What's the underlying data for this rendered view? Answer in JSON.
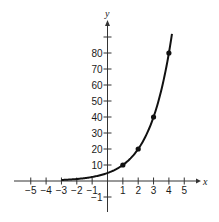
{
  "chart_data": {
    "type": "line",
    "title": "",
    "function": "y = 5 · 2^x",
    "xlabel": "x",
    "ylabel": "y",
    "xlim": [
      -5.5,
      5.8
    ],
    "ylim": [
      -5,
      100
    ],
    "x_ticks": [
      -5,
      -4,
      -3,
      -2,
      -1,
      1,
      2,
      3,
      4,
      5
    ],
    "x_tick_labels": [
      "−5",
      "−4",
      "−3",
      "−2",
      "−1",
      "1",
      "2",
      "3",
      "4",
      "5"
    ],
    "y_ticks": [
      -1,
      10,
      20,
      30,
      40,
      50,
      60,
      70,
      80,
      90
    ],
    "y_tick_labels": [
      "−1",
      "10",
      "20",
      "30",
      "40",
      "50",
      "60",
      "70",
      "80",
      ""
    ],
    "grid": false,
    "legend": null,
    "curve_domain": [
      -3,
      4.2
    ],
    "series": [
      {
        "name": "y = 5·2^x",
        "points": [
          {
            "x": 1,
            "y": 10
          },
          {
            "x": 2,
            "y": 20
          },
          {
            "x": 3,
            "y": 40
          },
          {
            "x": 4,
            "y": 80
          }
        ]
      }
    ],
    "line_color": "#111111",
    "axis_color": "#333333"
  }
}
